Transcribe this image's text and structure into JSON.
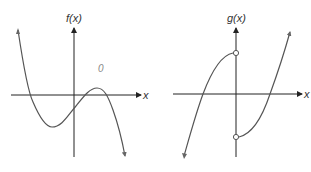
{
  "graphs": [
    {
      "id": "f",
      "y_axis_label": "f(x)",
      "x_axis_label": "x",
      "description": "cubic-like curve with negative leading coefficient: local min left of y-axis below x-axis, local max right of y-axis above x-axis, three x-intercepts",
      "annotation": "0"
    },
    {
      "id": "g",
      "y_axis_label": "g(x)",
      "x_axis_label": "x",
      "description": "piecewise function with jump discontinuity at x = 0; open circle on left branch above x-axis, open circle on right branch below x-axis",
      "open_points": [
        "left branch endpoint at x=0 (positive y)",
        "right branch endpoint at x=0 (negative y)"
      ]
    }
  ],
  "colors": {
    "curve": "#555555",
    "axis": "#222222",
    "background": "#ffffff"
  }
}
